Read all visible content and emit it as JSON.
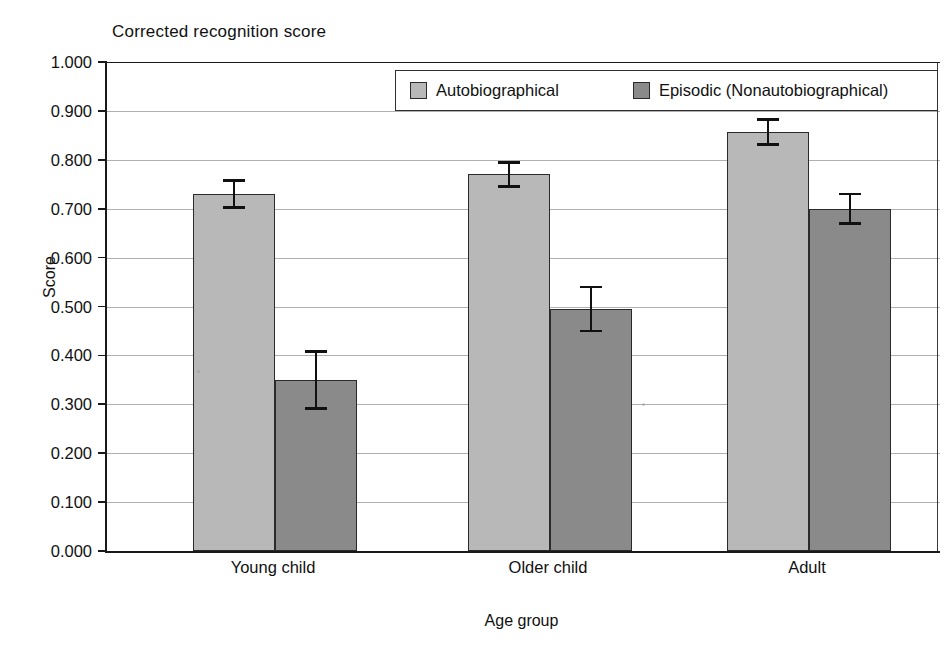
{
  "chart_data": {
    "type": "bar",
    "title": "Corrected recognition score",
    "xlabel": "Age group",
    "ylabel": "Score",
    "categories": [
      "Young child",
      "Older child",
      "Adult"
    ],
    "series": [
      {
        "name": "Autobiographical",
        "color": "#b8b8b8",
        "values": [
          0.73,
          0.77,
          0.857
        ],
        "errors": [
          0.028,
          0.025,
          0.025
        ]
      },
      {
        "name": "Episodic (Nonautobiographical)",
        "color": "#8a8a8a",
        "values": [
          0.35,
          0.495,
          0.7
        ],
        "errors": [
          0.058,
          0.045,
          0.03
        ]
      }
    ],
    "ylim": [
      0.0,
      1.0
    ],
    "ytick_labels": [
      "1.000",
      "0.900",
      "0.800",
      "0.700",
      "0.600",
      "0.500",
      "0.400",
      "0.300",
      "0.200",
      "0.100",
      "0.000"
    ],
    "ytick_values": [
      1.0,
      0.9,
      0.8,
      0.7,
      0.6,
      0.5,
      0.4,
      0.3,
      0.2,
      0.1,
      0.0
    ],
    "grid": true,
    "legend_position": "top-right",
    "error_bar_style": "capped"
  },
  "legend": {
    "entries": [
      {
        "label": "Autobiographical",
        "swatch": "light"
      },
      {
        "label": "Episodic (Nonautobiographical)",
        "swatch": "dark"
      }
    ]
  },
  "colors": {
    "series_light": "#b8b8b8",
    "series_dark": "#8a8a8a",
    "axis": "#1a1a1a",
    "grid": "#b0b0b0",
    "background": "#ffffff"
  }
}
